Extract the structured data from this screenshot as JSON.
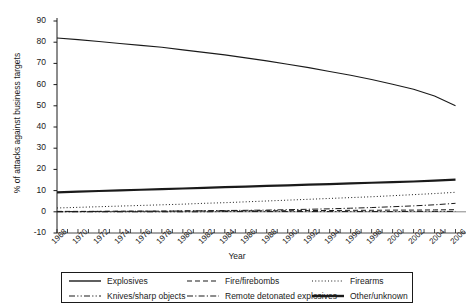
{
  "chart_data": {
    "type": "line",
    "title": "",
    "xlabel": "Year",
    "ylabel": "% of attacks against business targets",
    "xlim": [
      1968,
      2007
    ],
    "ylim": [
      -10,
      90
    ],
    "ytick_step": 10,
    "yticks": [
      -10,
      0,
      10,
      20,
      30,
      40,
      50,
      60,
      70,
      80,
      90
    ],
    "xticks": [
      1968,
      1970,
      1972,
      1974,
      1976,
      1978,
      1980,
      1982,
      1984,
      1986,
      1988,
      1990,
      1992,
      1994,
      1996,
      1998,
      2000,
      2002,
      2004,
      2006
    ],
    "grid": false,
    "legend_position": "bottom",
    "x": [
      1968,
      1970,
      1972,
      1974,
      1976,
      1978,
      1980,
      1982,
      1984,
      1986,
      1988,
      1990,
      1992,
      1994,
      1996,
      1998,
      2000,
      2002,
      2004,
      2006
    ],
    "series": [
      {
        "name": "Explosives",
        "style": "solid",
        "width": 1.1,
        "color": "#1a1a1a",
        "values": [
          82.0,
          81.2,
          80.3,
          79.4,
          78.5,
          77.6,
          76.4,
          75.2,
          74.0,
          72.6,
          71.2,
          69.6,
          68.0,
          66.2,
          64.4,
          62.4,
          60.2,
          57.8,
          54.6,
          50.0
        ]
      },
      {
        "name": "Fire/firebombs",
        "style": "dashed",
        "width": 1.0,
        "color": "#1a1a1a",
        "values": [
          0.2,
          0.2,
          0.2,
          0.3,
          0.3,
          0.3,
          0.4,
          0.4,
          0.4,
          0.5,
          0.5,
          0.5,
          0.6,
          0.6,
          0.7,
          0.7,
          0.8,
          0.8,
          0.9,
          1.0
        ]
      },
      {
        "name": "Firearms",
        "style": "dotted",
        "width": 1.0,
        "color": "#1a1a1a",
        "values": [
          1.8,
          2.1,
          2.4,
          2.7,
          3.0,
          3.3,
          3.6,
          4.0,
          4.3,
          4.7,
          5.1,
          5.5,
          5.9,
          6.3,
          6.7,
          7.1,
          7.6,
          8.1,
          8.6,
          9.2
        ]
      },
      {
        "name": "Knives/sharp objects",
        "style": "dashdotdot",
        "width": 1.0,
        "color": "#1a1a1a",
        "values": [
          0.0,
          0.0,
          0.0,
          0.0,
          0.0,
          0.0,
          0.0,
          0.0,
          0.1,
          0.1,
          0.1,
          0.1,
          0.1,
          0.1,
          0.1,
          0.1,
          0.1,
          0.2,
          0.2,
          0.2
        ]
      },
      {
        "name": "Remote detonated explosives",
        "style": "dashdot",
        "width": 1.0,
        "color": "#1a1a1a",
        "values": [
          0.1,
          0.1,
          0.2,
          0.2,
          0.3,
          0.3,
          0.4,
          0.5,
          0.6,
          0.7,
          0.8,
          1.0,
          1.2,
          1.4,
          1.7,
          2.0,
          2.4,
          2.8,
          3.3,
          4.0
        ]
      },
      {
        "name": "Other/unknown",
        "style": "solid",
        "width": 2.2,
        "color": "#1a1a1a",
        "values": [
          9.2,
          9.5,
          9.8,
          10.1,
          10.4,
          10.7,
          11.0,
          11.3,
          11.6,
          11.9,
          12.2,
          12.5,
          12.8,
          13.1,
          13.4,
          13.7,
          14.0,
          14.3,
          14.7,
          15.2
        ]
      }
    ]
  },
  "legend": {
    "entries": [
      {
        "label": "Explosives",
        "style": "solid",
        "width": 1.4
      },
      {
        "label": "Fire/firebombs",
        "style": "dashed",
        "width": 1.1
      },
      {
        "label": "Firearms",
        "style": "dotted",
        "width": 1.1
      },
      {
        "label": "Knives/sharp objects",
        "style": "dashdotdot",
        "width": 1.1
      },
      {
        "label": "Remote detonated explosives",
        "style": "dashdot",
        "width": 1.1
      },
      {
        "label": "Other/unknown",
        "style": "solid",
        "width": 2.4
      }
    ]
  },
  "axes": {
    "x_title": "Year",
    "y_title": "% of attacks against business targets"
  }
}
